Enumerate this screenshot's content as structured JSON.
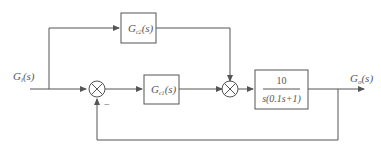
{
  "diagram": {
    "type": "control-system-block-diagram",
    "input": {
      "label": "G",
      "sub": "i",
      "arg": "(s)"
    },
    "output": {
      "label": "G",
      "sub": "o",
      "arg": "(s)"
    },
    "blocks": [
      {
        "id": "feedforward",
        "label": "G",
        "sub": "c2",
        "arg": "(s)"
      },
      {
        "id": "controller",
        "label": "G",
        "sub": "c1",
        "arg": "(s)"
      },
      {
        "id": "plant",
        "numerator": "10",
        "denominator": "s(0.1s+1)"
      }
    ],
    "summing_junctions": [
      {
        "id": "sum1",
        "feedback_sign": "−"
      },
      {
        "id": "sum2"
      }
    ],
    "colors": {
      "line": "#555555",
      "text": "#555555",
      "background": "#ffffff"
    }
  }
}
